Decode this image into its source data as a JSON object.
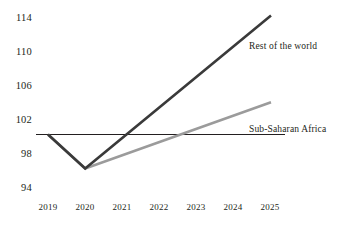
{
  "chart_data": {
    "type": "line",
    "title": "",
    "subtitle": "",
    "xlabel": "",
    "ylabel": "",
    "x": [
      2019,
      2020,
      2021,
      2022,
      2023,
      2024,
      2025
    ],
    "xtick_labels": [
      "2019",
      "2020",
      "2021",
      "2022",
      "2023",
      "2024",
      "2025"
    ],
    "ytick_labels": [
      "94",
      "98",
      "102",
      "106",
      "110",
      "114"
    ],
    "yticks": [
      94,
      98,
      102,
      106,
      110,
      114
    ],
    "ylim": [
      94,
      114
    ],
    "xlim": [
      2019,
      2025
    ],
    "grid": false,
    "legend_position": "inline-at-line-end",
    "reference_line": {
      "name": "baseline-100",
      "value": 100,
      "color": "#231f20",
      "style": "solid"
    },
    "series": [
      {
        "name": "Rest of the world",
        "color": "#3a3a3a",
        "width": 2.6,
        "x": [
          2019,
          2020,
          2025
        ],
        "values": [
          100,
          96,
          114
        ]
      },
      {
        "name": "Sub-Saharan Africa",
        "color": "#9b9b9b",
        "width": 2.6,
        "x": [
          2019,
          2020,
          2025
        ],
        "values": [
          100,
          96,
          103.8
        ]
      }
    ],
    "annotations": [
      {
        "name": "rest-of-the-world-label",
        "text": "Rest of the world",
        "x": 2025,
        "y": 111.2
      },
      {
        "name": "sub-saharan-africa-label",
        "text": "Sub-Saharan Africa",
        "x": 2025,
        "y": 101.6
      }
    ]
  },
  "axes": {
    "y": {
      "t0": "94",
      "t1": "98",
      "t2": "102",
      "t3": "106",
      "t4": "110",
      "t5": "114"
    },
    "x": {
      "t0": "2019",
      "t1": "2020",
      "t2": "2021",
      "t3": "2022",
      "t4": "2023",
      "t5": "2024",
      "t6": "2025"
    }
  },
  "labels": {
    "rest_of_world": "Rest of the world",
    "sub_saharan_africa": "Sub-Saharan Africa"
  },
  "colors": {
    "rest_of_world": "#3a3a3a",
    "sub_saharan_africa": "#9b9b9b",
    "baseline": "#231f20",
    "text": "#231f20",
    "background": "#ffffff"
  }
}
